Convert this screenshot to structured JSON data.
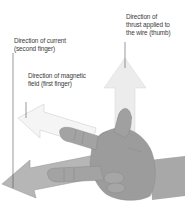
{
  "diagram": {
    "labels": {
      "thrust_line1": "Direction of",
      "thrust_line2": "thrust applied to",
      "thrust_line3": "the wire (thumb)",
      "current_line1": "Direction of current",
      "current_line2": "(second finger)",
      "field_line1": "Direction of magnetic",
      "field_line2": "field (first finger)"
    },
    "colors": {
      "thrust_arrow": "#ececec",
      "field_arrow": "#f4f4f4",
      "current_arrow": "#b4b4b4",
      "hand": "#9d9d9d",
      "leader_line": "#555555",
      "text": "#3a3a3a"
    }
  }
}
